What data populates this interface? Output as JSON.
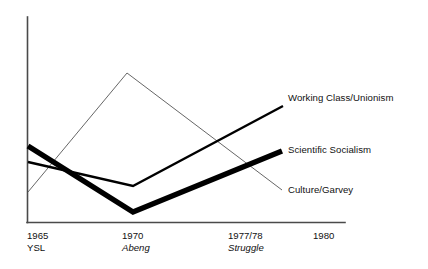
{
  "chart_data": {
    "type": "line",
    "title": "",
    "xlabel": "",
    "ylabel": "",
    "grid": false,
    "legend_position": "right-inline-labels",
    "xlim": [
      1963.5,
      1981.5
    ],
    "ylim": [
      0,
      100
    ],
    "x_tick_values": [
      1965,
      1970,
      1977.5,
      1980
    ],
    "x_tick_labels": [
      "1965",
      "1970",
      "1977/78",
      "1980"
    ],
    "x_tick_sublabels": [
      "YSL",
      "Abeng",
      "Struggle",
      ""
    ],
    "x_tick_sublabel_styles": [
      "normal",
      "italic",
      "italic",
      "normal"
    ],
    "series": [
      {
        "name": "Working Class/Unionism",
        "weight": "medium",
        "x": [
          1965,
          1970,
          1977.5
        ],
        "values": [
          29,
          17,
          56
        ],
        "points_px": [
          [
            28,
            162
          ],
          [
            133,
            186
          ],
          [
            283,
            106
          ]
        ]
      },
      {
        "name": "Scientific Socialism",
        "weight": "thick",
        "x": [
          1965,
          1970,
          1977.5
        ],
        "values": [
          37,
          5,
          35
        ],
        "points_px": [
          [
            28,
            146
          ],
          [
            133,
            212
          ],
          [
            282,
            151
          ]
        ]
      },
      {
        "name": "Culture/Garvey",
        "weight": "thin",
        "x": [
          1965,
          1969.6,
          1977.5
        ],
        "values": [
          15,
          73,
          16
        ],
        "points_px": [
          [
            28,
            192
          ],
          [
            127,
            73
          ],
          [
            282,
            190
          ]
        ]
      }
    ]
  },
  "labels": {
    "working_class": "Working Class/Unionism",
    "scientific_socialism": "Scientific Socialism",
    "culture_garvey": "Culture/Garvey"
  },
  "ticks": [
    {
      "year": "1965",
      "sub": "YSL"
    },
    {
      "year": "1970",
      "sub": "Abeng"
    },
    {
      "year": "1977/78",
      "sub": "Struggle"
    },
    {
      "year": "1980",
      "sub": ""
    }
  ],
  "colors": {
    "ink": "#000000",
    "axis": "#4a4a4a",
    "thin_line": "#555555",
    "background": "#ffffff"
  }
}
